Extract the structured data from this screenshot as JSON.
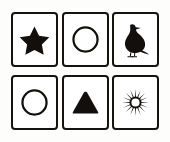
{
  "board": {
    "title": "Symbol Cards",
    "description": "Six bordered cards arranged in a two-row, three-column grid, each showing a black symbol on white",
    "rows": 2,
    "columns": 3,
    "ink_color": "#120f0c",
    "card_background": "#ffffff",
    "page_background": "#fdfdfc",
    "border_color": "#15130f"
  },
  "cards": [
    {
      "index": 1,
      "row": 1,
      "column": 1,
      "symbol": "star",
      "label": "Star",
      "icon_name": "star-icon",
      "style": "filled",
      "points": 5,
      "color": "#120f0c"
    },
    {
      "index": 2,
      "row": 1,
      "column": 2,
      "symbol": "circle",
      "label": "Circle",
      "icon_name": "circle-outline-icon",
      "style": "outline",
      "points": 0,
      "color": "#120f0c"
    },
    {
      "index": 3,
      "row": 1,
      "column": 3,
      "symbol": "bird",
      "label": "Bird",
      "icon_name": "bird-icon",
      "style": "filled",
      "points": 0,
      "color": "#120f0c"
    },
    {
      "index": 4,
      "row": 2,
      "column": 1,
      "symbol": "circle",
      "label": "Circle",
      "icon_name": "circle-outline-icon",
      "style": "outline",
      "points": 0,
      "color": "#120f0c"
    },
    {
      "index": 5,
      "row": 2,
      "column": 2,
      "symbol": "triangle",
      "label": "Triangle",
      "icon_name": "triangle-icon",
      "style": "filled",
      "points": 3,
      "color": "#120f0c"
    },
    {
      "index": 6,
      "row": 2,
      "column": 3,
      "symbol": "sunburst",
      "label": "Sunburst",
      "icon_name": "sunburst-icon",
      "style": "filled",
      "points": 16,
      "color": "#120f0c"
    }
  ]
}
